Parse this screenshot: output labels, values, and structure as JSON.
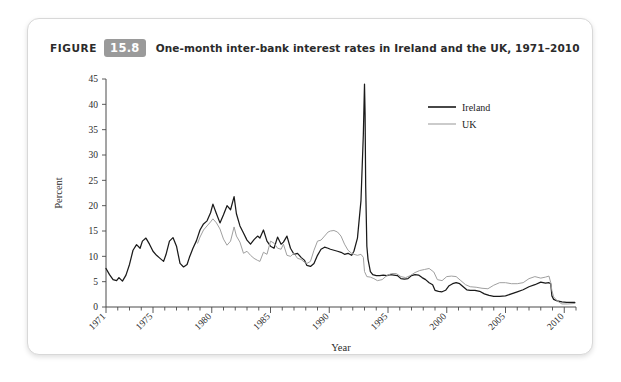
{
  "figure": {
    "label": "FIGURE",
    "number": "15.8",
    "title": "One-month inter-bank interest rates in Ireland and the UK, 1971–2010"
  },
  "chart_data": {
    "type": "line",
    "title": "One-month inter-bank interest rates in Ireland and the UK, 1971–2010",
    "xlabel": "Year",
    "ylabel": "Percent",
    "xlim": [
      1971,
      2011
    ],
    "ylim": [
      0,
      45
    ],
    "yticks": [
      0,
      5,
      10,
      15,
      20,
      25,
      30,
      35,
      40,
      45
    ],
    "xticks": [
      1971,
      1975,
      1980,
      1985,
      1990,
      1995,
      2000,
      2005,
      2010
    ],
    "xtick_labels": [
      "1971",
      "1975",
      "1980",
      "1985",
      "1990",
      "1995",
      "2000",
      "2005",
      "2010"
    ],
    "ytick_labels": [
      "0",
      "5",
      "10",
      "15",
      "20",
      "25",
      "30",
      "35",
      "40",
      "45"
    ],
    "grid": false,
    "legend_position": "top-right",
    "colors": {
      "ireland": "#1a1a1a",
      "uk": "#a0a0a0"
    },
    "series": [
      {
        "name": "Ireland",
        "color": "#1a1a1a",
        "x": [
          1971.0,
          1971.3,
          1971.6,
          1971.9,
          1972.1,
          1972.4,
          1972.7,
          1973.0,
          1973.3,
          1973.6,
          1973.9,
          1974.1,
          1974.4,
          1974.7,
          1975.0,
          1975.3,
          1975.6,
          1975.9,
          1976.1,
          1976.4,
          1976.7,
          1977.0,
          1977.3,
          1977.6,
          1977.9,
          1978.1,
          1978.4,
          1978.7,
          1979.0,
          1979.3,
          1979.6,
          1979.9,
          1980.1,
          1980.4,
          1980.7,
          1981.0,
          1981.3,
          1981.6,
          1981.9,
          1982.1,
          1982.4,
          1982.7,
          1983.0,
          1983.3,
          1983.6,
          1983.9,
          1984.1,
          1984.4,
          1984.7,
          1985.0,
          1985.3,
          1985.6,
          1985.9,
          1986.1,
          1986.4,
          1986.7,
          1987.0,
          1987.3,
          1987.6,
          1987.9,
          1988.1,
          1988.4,
          1988.7,
          1989.0,
          1989.3,
          1989.6,
          1989.9,
          1990.1,
          1990.4,
          1990.7,
          1991.0,
          1991.3,
          1991.6,
          1991.9,
          1992.1,
          1992.4,
          1992.7,
          1992.9,
          1993.0,
          1993.05,
          1993.1,
          1993.2,
          1993.3,
          1993.5,
          1993.7,
          1994.0,
          1994.3,
          1994.6,
          1994.9,
          1995.2,
          1995.5,
          1995.8,
          1996.1,
          1996.4,
          1996.7,
          1997.0,
          1997.3,
          1997.6,
          1997.9,
          1998.2,
          1998.5,
          1998.8,
          1999.0,
          1999.3,
          1999.6,
          1999.9,
          2000.2,
          2000.5,
          2000.8,
          2001.1,
          2001.4,
          2001.7,
          2002.0,
          2002.4,
          2002.8,
          2003.2,
          2003.6,
          2004.0,
          2004.5,
          2005.0,
          2005.5,
          2006.0,
          2006.5,
          2007.0,
          2007.5,
          2008.0,
          2008.4,
          2008.7,
          2008.85,
          2008.95,
          2009.1,
          2009.4,
          2009.8,
          2010.2,
          2010.6,
          2010.9
        ],
        "y": [
          7.6,
          6.4,
          5.4,
          5.2,
          5.8,
          5.1,
          6.3,
          8.4,
          11.2,
          12.3,
          11.6,
          13.0,
          13.6,
          12.4,
          11.0,
          10.2,
          9.6,
          9.0,
          10.3,
          13.0,
          13.7,
          12.0,
          8.6,
          7.9,
          8.4,
          9.8,
          11.6,
          13.1,
          15.2,
          16.4,
          17.0,
          18.6,
          20.3,
          18.4,
          16.6,
          18.2,
          20.0,
          19.2,
          21.8,
          18.4,
          16.0,
          14.6,
          13.2,
          12.4,
          13.3,
          14.0,
          13.6,
          15.2,
          13.0,
          12.0,
          11.6,
          13.8,
          12.4,
          12.8,
          14.0,
          11.6,
          10.4,
          10.6,
          9.8,
          9.2,
          8.2,
          8.0,
          8.6,
          10.2,
          11.4,
          11.8,
          11.6,
          11.4,
          11.2,
          11.0,
          10.8,
          10.4,
          10.6,
          10.2,
          11.0,
          13.6,
          21.0,
          34.0,
          44.0,
          38.0,
          24.0,
          12.0,
          9.4,
          7.0,
          6.4,
          6.2,
          6.2,
          6.3,
          6.2,
          6.4,
          6.3,
          6.2,
          5.6,
          5.5,
          5.6,
          6.2,
          6.4,
          6.3,
          5.8,
          5.4,
          4.8,
          4.4,
          3.3,
          3.1,
          3.0,
          3.3,
          4.2,
          4.6,
          4.8,
          4.6,
          4.0,
          3.4,
          3.3,
          3.3,
          3.1,
          2.6,
          2.3,
          2.1,
          2.1,
          2.2,
          2.6,
          3.0,
          3.4,
          4.0,
          4.4,
          4.9,
          4.7,
          4.8,
          4.6,
          2.2,
          1.5,
          1.2,
          1.0,
          0.9,
          0.9,
          0.9
        ],
        "note": "Irish one-month inter-bank rate; 1993 ERM crisis spike to ~44%"
      },
      {
        "name": "UK",
        "color": "#a0a0a0",
        "x": [
          1978.8,
          1979.0,
          1979.3,
          1979.6,
          1979.9,
          1980.1,
          1980.4,
          1980.7,
          1981.0,
          1981.3,
          1981.6,
          1981.9,
          1982.1,
          1982.4,
          1982.7,
          1983.0,
          1983.3,
          1983.6,
          1983.9,
          1984.1,
          1984.4,
          1984.7,
          1985.0,
          1985.3,
          1985.6,
          1985.9,
          1986.1,
          1986.4,
          1986.7,
          1987.0,
          1987.3,
          1987.6,
          1987.9,
          1988.1,
          1988.4,
          1988.7,
          1989.0,
          1989.3,
          1989.6,
          1989.9,
          1990.1,
          1990.4,
          1990.7,
          1991.0,
          1991.3,
          1991.6,
          1991.9,
          1992.1,
          1992.4,
          1992.7,
          1992.9,
          1993.0,
          1993.2,
          1993.5,
          1993.8,
          1994.1,
          1994.5,
          1994.9,
          1995.3,
          1995.7,
          1996.1,
          1996.5,
          1996.9,
          1997.3,
          1997.7,
          1998.1,
          1998.5,
          1998.9,
          1999.2,
          1999.6,
          2000.0,
          2000.4,
          2000.8,
          2001.2,
          2001.6,
          2002.0,
          2002.5,
          2003.0,
          2003.5,
          2004.0,
          2004.5,
          2005.0,
          2005.5,
          2006.0,
          2006.5,
          2007.0,
          2007.5,
          2008.0,
          2008.4,
          2008.7,
          2008.85,
          2008.95,
          2009.1,
          2009.4,
          2009.8,
          2010.3,
          2010.9
        ],
        "y": [
          12.6,
          13.8,
          15.2,
          16.0,
          16.8,
          17.4,
          16.6,
          15.4,
          13.4,
          12.2,
          13.0,
          15.8,
          14.0,
          12.8,
          10.6,
          11.0,
          10.2,
          9.6,
          9.2,
          9.0,
          10.8,
          10.4,
          13.0,
          12.6,
          11.6,
          11.4,
          12.4,
          10.2,
          10.0,
          10.6,
          9.6,
          9.4,
          8.8,
          8.6,
          9.0,
          11.2,
          13.0,
          13.2,
          14.0,
          14.8,
          15.0,
          15.1,
          14.8,
          14.0,
          12.4,
          11.2,
          10.6,
          10.4,
          10.2,
          10.4,
          9.8,
          7.0,
          6.0,
          5.9,
          5.6,
          5.2,
          5.4,
          6.2,
          6.6,
          6.6,
          6.0,
          5.8,
          6.2,
          6.8,
          7.2,
          7.4,
          7.6,
          6.9,
          5.4,
          5.2,
          6.0,
          6.1,
          6.0,
          5.2,
          4.4,
          4.0,
          3.9,
          3.7,
          3.6,
          4.3,
          4.8,
          4.8,
          4.6,
          4.6,
          4.8,
          5.6,
          6.0,
          5.7,
          5.9,
          6.1,
          4.8,
          3.2,
          2.0,
          1.2,
          0.6,
          0.6,
          0.7
        ],
        "note": "UK one-month inter-bank rate; series begins circa 1979"
      }
    ],
    "legend": [
      {
        "label": "Ireland",
        "color": "#1a1a1a"
      },
      {
        "label": "UK",
        "color": "#a0a0a0"
      }
    ]
  }
}
